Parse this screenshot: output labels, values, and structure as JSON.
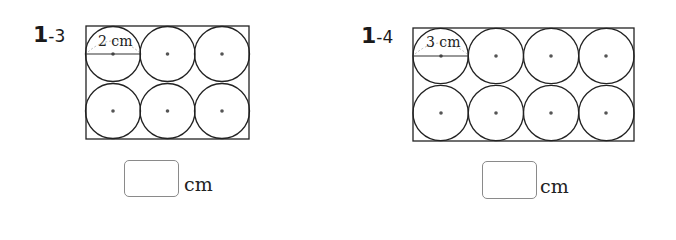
{
  "problems": [
    {
      "number": "1",
      "sub": "-3",
      "diameter_label": "2 cm",
      "rows": 2,
      "cols": 3,
      "answer_value": "",
      "unit": "cm"
    },
    {
      "number": "1",
      "sub": "-4",
      "diameter_label": "3 cm",
      "rows": 2,
      "cols": 4,
      "answer_value": "",
      "unit": "cm"
    }
  ],
  "colors": {
    "line": "#222222",
    "dot": "#555555",
    "box_border": "#8a8a8a",
    "dash": "#bbbbbb"
  }
}
